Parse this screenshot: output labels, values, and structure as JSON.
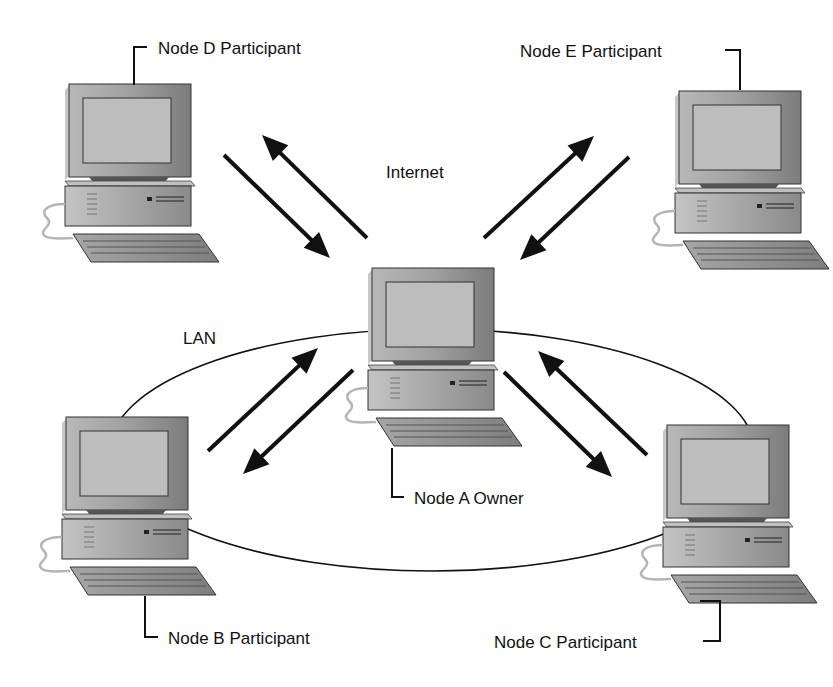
{
  "diagram": {
    "type": "network-topology",
    "network_labels": {
      "internet": "Internet",
      "lan": "LAN"
    },
    "nodes": [
      {
        "id": "A",
        "label": "Node A Owner",
        "role": "Owner",
        "network": "LAN"
      },
      {
        "id": "B",
        "label": "Node B Participant",
        "role": "Participant",
        "network": "LAN"
      },
      {
        "id": "C",
        "label": "Node C Participant",
        "role": "Participant",
        "network": "LAN"
      },
      {
        "id": "D",
        "label": "Node D Participant",
        "role": "Participant",
        "network": "Internet"
      },
      {
        "id": "E",
        "label": "Node E Participant",
        "role": "Participant",
        "network": "Internet"
      }
    ],
    "links": [
      {
        "from": "A",
        "to": "B",
        "direction": "bidirectional"
      },
      {
        "from": "A",
        "to": "C",
        "direction": "bidirectional"
      },
      {
        "from": "A",
        "to": "D",
        "direction": "bidirectional"
      },
      {
        "from": "A",
        "to": "E",
        "direction": "bidirectional"
      }
    ],
    "colors": {
      "line": "#111111",
      "monitor_body": "#9a9a9a",
      "screen": "#bdbdbd",
      "cpu_case": "#a8a8a8",
      "keyboard": "#8e8e8e",
      "cable": "#b5b5b5"
    }
  }
}
